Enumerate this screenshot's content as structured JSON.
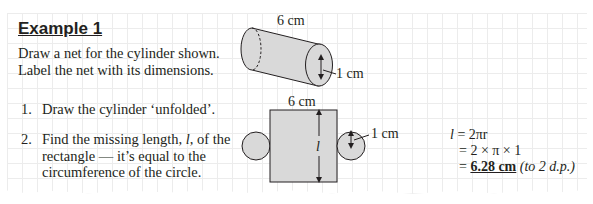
{
  "example": {
    "title": "Example 1",
    "intro_line1": "Draw a net for the cylinder shown.",
    "intro_line2": "Label the net with its dimensions."
  },
  "steps": [
    {
      "number": "1.",
      "text": "Draw the cylinder ‘unfolded’."
    },
    {
      "number": "2.",
      "text_line1": "Find the missing length, ",
      "variable": "l",
      "text_line1_end": ", of the",
      "text_line2": "rectangle — it’s equal to the",
      "text_line3": "circumference of the circle."
    }
  ],
  "cylinder_diagram": {
    "length_label": "6 cm",
    "radius_label": "1 cm"
  },
  "net_diagram": {
    "width_label": "6 cm",
    "length_label": "l",
    "radius_label": "1 cm"
  },
  "calculation": {
    "line1_lhs": "l",
    "line1_rhs": "= 2πr",
    "line2": "= 2 × π × 1",
    "line3_eq": "=",
    "answer": "6.28 cm",
    "note": "(to 2 d.p.)"
  },
  "colors": {
    "shape_fill": "#d9d9d9",
    "stroke": "#231f20",
    "grid": "#ececec"
  }
}
